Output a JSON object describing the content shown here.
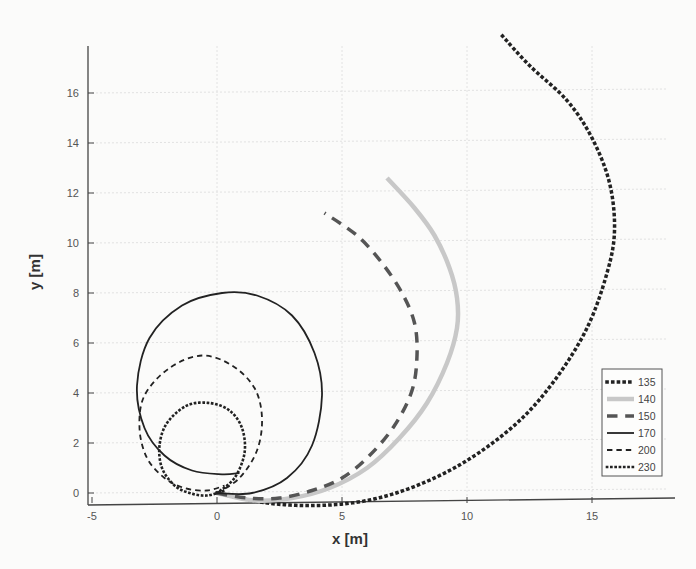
{
  "chart_data": {
    "type": "line",
    "title": "",
    "xlabel": "x [m]",
    "ylabel": "y [m]",
    "xlim": [
      -5,
      18.5
    ],
    "ylim": [
      -0.6,
      18
    ],
    "xticks": [
      -5,
      0,
      5,
      10,
      15
    ],
    "yticks": [
      0,
      2,
      4,
      6,
      8,
      10,
      12,
      14,
      16
    ],
    "grid": true,
    "legend_position": "lower right (inside)",
    "series": [
      {
        "name": "135",
        "style": "dotted",
        "color": "#222222",
        "width": 3.5,
        "x": [
          0,
          2,
          4,
          6,
          8,
          10,
          12,
          13.5,
          14.8,
          15.6,
          15.9,
          15.7,
          15.0,
          14.0,
          12.5,
          11.4
        ],
        "y": [
          0,
          -0.4,
          -0.5,
          -0.3,
          0.3,
          1.3,
          2.8,
          4.5,
          6.6,
          8.8,
          10.5,
          12.4,
          14.2,
          15.7,
          17.1,
          18.3
        ]
      },
      {
        "name": "140",
        "style": "solid",
        "color": "#c8c8c8",
        "width": 4.5,
        "x": [
          0,
          1.5,
          3,
          4.5,
          6,
          7.3,
          8.4,
          9.2,
          9.6,
          9.6,
          9.3,
          8.7,
          7.9,
          6.8
        ],
        "y": [
          0,
          -0.3,
          -0.2,
          0.2,
          1.0,
          2.2,
          3.6,
          5.2,
          6.6,
          7.8,
          9.0,
          10.3,
          11.4,
          12.6
        ]
      },
      {
        "name": "150",
        "style": "dashed",
        "color": "#555555",
        "width": 3.5,
        "x": [
          0,
          1.2,
          2.5,
          3.8,
          5.0,
          6.1,
          7.1,
          7.8,
          8.0,
          7.9,
          7.4,
          6.6,
          5.6,
          4.3
        ],
        "y": [
          0,
          -0.2,
          -0.2,
          0.1,
          0.6,
          1.5,
          2.7,
          4.1,
          5.5,
          6.8,
          8.0,
          9.2,
          10.3,
          11.2
        ]
      },
      {
        "name": "170",
        "style": "solid",
        "color": "#222222",
        "width": 1.8,
        "x": [
          0,
          1.4,
          2.8,
          3.8,
          4.2,
          3.9,
          3.0,
          1.6,
          0.2,
          -1.4,
          -2.7,
          -3.2,
          -2.9,
          -2.1,
          -1.0,
          0.2,
          0.9
        ],
        "y": [
          0,
          0.0,
          0.6,
          1.9,
          3.9,
          5.6,
          7.1,
          7.9,
          8.0,
          7.5,
          6.2,
          4.3,
          2.6,
          1.5,
          0.9,
          0.75,
          0.8
        ]
      },
      {
        "name": "200",
        "style": "dashed",
        "color": "#222222",
        "width": 1.8,
        "x": [
          0,
          0.9,
          1.6,
          1.8,
          1.5,
          0.6,
          -0.6,
          -1.9,
          -2.9,
          -3.1,
          -2.8,
          -2.1,
          -1.3,
          -0.4,
          0.3
        ],
        "y": [
          0,
          0.6,
          1.7,
          3.0,
          4.2,
          5.1,
          5.5,
          5.0,
          3.9,
          2.6,
          1.4,
          0.6,
          0.2,
          0.1,
          0.3
        ]
      },
      {
        "name": "230",
        "style": "dotted",
        "color": "#222222",
        "width": 2.6,
        "x": [
          0,
          0.7,
          1.1,
          1.0,
          0.5,
          -0.3,
          -1.2,
          -2.0,
          -2.3,
          -2.2,
          -1.7,
          -1.1,
          -0.4,
          0.3
        ],
        "y": [
          0,
          0.6,
          1.6,
          2.6,
          3.3,
          3.6,
          3.5,
          2.8,
          1.9,
          1.0,
          0.3,
          0.0,
          -0.1,
          0.1
        ]
      }
    ]
  },
  "legend": {
    "items": [
      "135",
      "140",
      "150",
      "170",
      "200",
      "230"
    ]
  },
  "axes": {
    "xlabel": "x [m]",
    "ylabel": "y [m]",
    "xtick_labels": [
      "-5",
      "0",
      "5",
      "10",
      "15"
    ],
    "ytick_labels": [
      "0",
      "2",
      "4",
      "6",
      "8",
      "10",
      "12",
      "14",
      "16"
    ]
  }
}
